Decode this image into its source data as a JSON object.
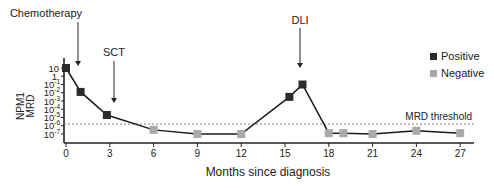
{
  "chart_data": {
    "type": "line",
    "title": "",
    "xlabel": "Months since diagnosis",
    "ylabel": [
      "NPM1",
      "MRD"
    ],
    "yscale": "log",
    "xlim": [
      0,
      28
    ],
    "ylim_exp": [
      -7,
      1
    ],
    "x_ticks": [
      0,
      3,
      6,
      9,
      12,
      15,
      18,
      21,
      24,
      27
    ],
    "y_ticks": [
      {
        "exp": 1,
        "label": "10"
      },
      {
        "exp": 0,
        "label": "1"
      },
      {
        "exp": -1,
        "label": "10",
        "sup": "-1"
      },
      {
        "exp": -2,
        "label": "10",
        "sup": "-2"
      },
      {
        "exp": -3,
        "label": "10",
        "sup": "-3"
      },
      {
        "exp": -4,
        "label": "10",
        "sup": "-4"
      },
      {
        "exp": -5,
        "label": "10",
        "sup": "-5"
      },
      {
        "exp": -6,
        "label": "10",
        "sup": "-6"
      },
      {
        "exp": -7,
        "label": "10",
        "sup": "-7"
      }
    ],
    "grid": false,
    "series": [
      {
        "name": "NPM1 MRD",
        "points": [
          {
            "x": 0,
            "exp": 1.0,
            "status": "Positive"
          },
          {
            "x": 1,
            "exp": -1.9,
            "status": "Positive"
          },
          {
            "x": 2.8,
            "exp": -4.7,
            "status": "Positive"
          },
          {
            "x": 6,
            "exp": -6.5,
            "status": "Negative"
          },
          {
            "x": 9,
            "exp": -7.0,
            "status": "Negative"
          },
          {
            "x": 12,
            "exp": -7.0,
            "status": "Negative"
          },
          {
            "x": 15.3,
            "exp": -2.5,
            "status": "Positive"
          },
          {
            "x": 16.2,
            "exp": -1.0,
            "status": "Positive"
          },
          {
            "x": 18,
            "exp": -6.9,
            "status": "Negative"
          },
          {
            "x": 19,
            "exp": -6.9,
            "status": "Negative"
          },
          {
            "x": 21,
            "exp": -7.0,
            "status": "Negative"
          },
          {
            "x": 24,
            "exp": -6.6,
            "status": "Negative"
          },
          {
            "x": 27,
            "exp": -6.9,
            "status": "Negative"
          }
        ]
      }
    ],
    "threshold": {
      "label": "MRD threshold",
      "exp": -5.8
    },
    "annotations": [
      {
        "label": "Chemotherapy",
        "x": 1
      },
      {
        "label": "SCT",
        "x": 3.3
      },
      {
        "label": "DLI",
        "x": 16.2
      }
    ],
    "legend": {
      "position": "right",
      "entries": [
        {
          "label": "Positive",
          "color": "#2b2b2b"
        },
        {
          "label": "Negative",
          "color": "#a9a9a9"
        }
      ]
    }
  }
}
